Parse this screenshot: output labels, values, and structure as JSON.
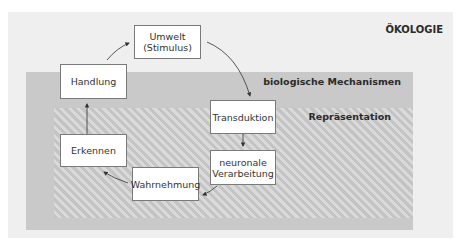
{
  "panels": {
    "ecology": {
      "label": "ÖKOLOGIE",
      "color": "#efefef"
    },
    "biological_mechanisms": {
      "label": "biologische Mechanismen",
      "color": "#c9c9c9"
    },
    "representation": {
      "label": "Repräsentation",
      "pattern": "diagonal-hatch"
    }
  },
  "nodes": [
    {
      "id": "umwelt",
      "label": "Umwelt\n(Stimulus)",
      "line1": "Umwelt",
      "line2": "(Stimulus)"
    },
    {
      "id": "transduktion",
      "label": "Transduktion"
    },
    {
      "id": "neuronale",
      "label": "neuronale Verarbeitung",
      "line1": "neuronale",
      "line2": "Verarbeitung"
    },
    {
      "id": "wahrnehmung",
      "label": "Wahrnehmung"
    },
    {
      "id": "erkennen",
      "label": "Erkennen"
    },
    {
      "id": "handlung",
      "label": "Handlung"
    }
  ],
  "edges": [
    {
      "from": "umwelt",
      "to": "transduktion"
    },
    {
      "from": "transduktion",
      "to": "neuronale"
    },
    {
      "from": "neuronale",
      "to": "wahrnehmung"
    },
    {
      "from": "wahrnehmung",
      "to": "erkennen"
    },
    {
      "from": "erkennen",
      "to": "handlung"
    },
    {
      "from": "handlung",
      "to": "umwelt"
    }
  ]
}
